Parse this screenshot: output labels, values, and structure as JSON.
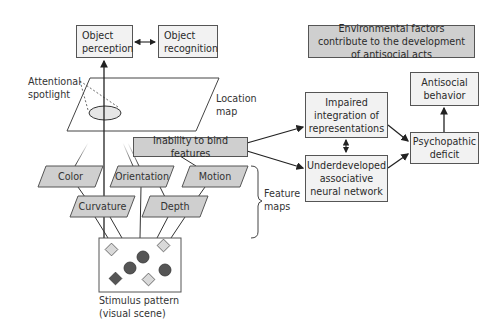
{
  "diagram": {
    "boxes": {
      "object_perception": "Object perception",
      "object_recognition": "Object recognition",
      "environmental_factors": "Environmental factors contribute to the development of antisocial acts",
      "inability_to_bind": "Inability to bind features",
      "impaired_integration": "Impaired integration of representations",
      "underdeveloped_network": "Underdeveloped associative neural network",
      "psychopathic_deficit": "Psychopathic deficit",
      "antisocial_behavior": "Antisocial behavior"
    },
    "labels": {
      "attentional_spotlight": "Attentional spotlight",
      "location_map": "Location map",
      "feature_maps": "Feature maps",
      "stimulus_pattern": "Stimulus pattern (visual scene)"
    },
    "feature_maps": [
      "Color",
      "Orientation",
      "Motion",
      "Curvature",
      "Depth"
    ],
    "stimulus_shapes": [
      {
        "shape": "diamond",
        "fill": "light"
      },
      {
        "shape": "circle",
        "fill": "dark"
      },
      {
        "shape": "diamond",
        "fill": "light"
      },
      {
        "shape": "circle",
        "fill": "dark"
      },
      {
        "shape": "circle",
        "fill": "dark"
      },
      {
        "shape": "diamond",
        "fill": "dark"
      },
      {
        "shape": "diamond",
        "fill": "light"
      }
    ],
    "colors": {
      "box_light": "#f2f2f2",
      "box_dark": "#cfcfcf",
      "stroke": "#555555",
      "shape_dark": "#555555",
      "shape_light": "#d9d9d9"
    }
  }
}
